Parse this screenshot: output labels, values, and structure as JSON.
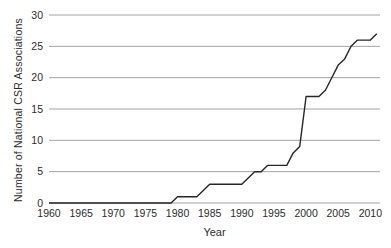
{
  "figure": {
    "background_color": "#ffffff",
    "line_color": "#262626",
    "grid_color": "#a3a3a3",
    "text_color": "#2b2b2b"
  },
  "chart_data": {
    "type": "line",
    "title": "",
    "xlabel": "Year",
    "ylabel": "Number of National CSR Associations",
    "xlim": [
      1960,
      2011.5
    ],
    "ylim": [
      0,
      30
    ],
    "x_ticks": [
      1960,
      1965,
      1970,
      1975,
      1980,
      1985,
      1990,
      1995,
      2000,
      2005,
      2010
    ],
    "y_ticks": [
      0,
      5,
      10,
      15,
      20,
      25,
      30
    ],
    "grid": "horizontal-only",
    "legend": "none",
    "series": [
      {
        "name": "Cumulative number of national CSR associations",
        "x": [
          1960,
          1961,
          1962,
          1963,
          1964,
          1965,
          1966,
          1967,
          1968,
          1969,
          1970,
          1971,
          1972,
          1973,
          1974,
          1975,
          1976,
          1977,
          1978,
          1979,
          1980,
          1981,
          1982,
          1983,
          1984,
          1985,
          1986,
          1987,
          1988,
          1989,
          1990,
          1991,
          1992,
          1993,
          1994,
          1995,
          1996,
          1997,
          1998,
          1999,
          2000,
          2001,
          2002,
          2003,
          2004,
          2005,
          2006,
          2007,
          2008,
          2009,
          2010,
          2011
        ],
        "y": [
          0,
          0,
          0,
          0,
          0,
          0,
          0,
          0,
          0,
          0,
          0,
          0,
          0,
          0,
          0,
          0,
          0,
          0,
          0,
          0,
          1,
          1,
          1,
          1,
          2,
          3,
          3,
          3,
          3,
          3,
          3,
          4,
          5,
          5,
          6,
          6,
          6,
          6,
          8,
          9,
          17,
          17,
          17,
          18,
          20,
          22,
          23,
          25,
          26,
          26,
          26,
          27
        ]
      }
    ]
  }
}
